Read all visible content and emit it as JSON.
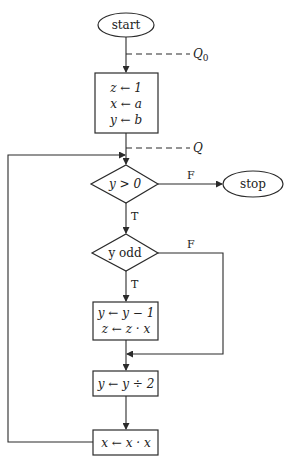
{
  "diagram": {
    "type": "flowchart",
    "title": "",
    "nodes": {
      "start": {
        "kind": "terminal",
        "label": "start"
      },
      "init": {
        "kind": "process",
        "lines": [
          "z ← 1",
          "x ← a",
          "y ← b"
        ]
      },
      "cond_positive": {
        "kind": "decision",
        "label": "y > 0"
      },
      "stop": {
        "kind": "terminal",
        "label": "stop"
      },
      "cond_odd": {
        "kind": "decision",
        "label": "y odd"
      },
      "odd_step": {
        "kind": "process",
        "lines": [
          "y ← y − 1",
          "z ← z · x"
        ]
      },
      "halve": {
        "kind": "process",
        "lines": [
          "y ← y ÷ 2"
        ]
      },
      "square": {
        "kind": "process",
        "lines": [
          "x ← x · x"
        ]
      }
    },
    "assertions": {
      "q0": {
        "label": "Q",
        "subscript": "0"
      },
      "q": {
        "label": "Q"
      }
    },
    "edge_labels": {
      "positive_false": "F",
      "positive_true": "T",
      "odd_false": "F",
      "odd_true": "T"
    },
    "edges": [
      {
        "from": "start",
        "to": "init"
      },
      {
        "from": "init",
        "to": "cond_positive"
      },
      {
        "from": "cond_positive",
        "to": "stop",
        "label": "F"
      },
      {
        "from": "cond_positive",
        "to": "cond_odd",
        "label": "T"
      },
      {
        "from": "cond_odd",
        "to": "odd_step",
        "label": "T"
      },
      {
        "from": "cond_odd",
        "to": "halve",
        "label": "F"
      },
      {
        "from": "odd_step",
        "to": "halve"
      },
      {
        "from": "halve",
        "to": "square"
      },
      {
        "from": "square",
        "to": "cond_positive"
      }
    ]
  }
}
